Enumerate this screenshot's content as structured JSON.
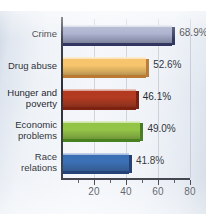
{
  "chart_data": {
    "type": "bar",
    "orientation": "horizontal",
    "title": "",
    "xlabel": "",
    "ylabel": "",
    "categories": [
      "Crime",
      "Drug abuse",
      "Hunger and poverty",
      "Economic problems",
      "Race relations"
    ],
    "values": [
      68.9,
      52.6,
      46.1,
      49.0,
      41.8
    ],
    "value_labels": [
      "68.9%",
      "52.6%",
      "46.1%",
      "49.0%",
      "41.8%"
    ],
    "category_lines": [
      [
        "Crime"
      ],
      [
        "Drug abuse"
      ],
      [
        "Hunger and",
        "poverty"
      ],
      [
        "Economic",
        "problems"
      ],
      [
        "Race",
        "relations"
      ]
    ],
    "bar_colors": [
      "#9aa2c4",
      "#f5c164",
      "#b33a20",
      "#8fc23f",
      "#2a63b0"
    ],
    "bar_colors_dark": [
      "#1c2250",
      "#b8762c",
      "#7b1d0c",
      "#3d7a12",
      "#0f2f6b"
    ],
    "xlim": [
      0,
      80.5
    ],
    "xticks": [
      20,
      40,
      60,
      80
    ],
    "xtick_labels": [
      "20",
      "40",
      "60",
      "80"
    ],
    "xminor_ticks": [
      10,
      30,
      50,
      70
    ],
    "gridlines": [
      20,
      40,
      60,
      80
    ],
    "grid": true,
    "legend": null
  },
  "figure": {
    "background_color": "#eef2f7",
    "axis_color": "#2b2f38",
    "text_color": "#20242c"
  }
}
